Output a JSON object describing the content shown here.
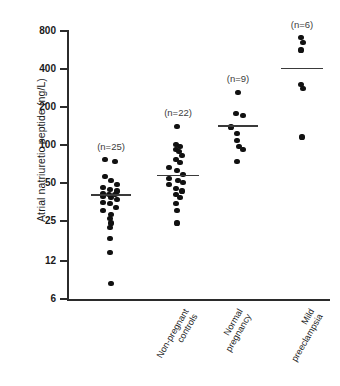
{
  "chart_data": {
    "type": "scatter",
    "title": "",
    "xlabel": "",
    "ylabel": "Atrial natriuretic peptide (ng/L)",
    "yscale": "log",
    "ylim": [
      6,
      800
    ],
    "yticks": [
      6,
      12,
      25,
      50,
      100,
      200,
      400,
      800
    ],
    "ytick_labels": [
      "6",
      "12",
      "25",
      "50",
      "100",
      "200",
      "400",
      "800"
    ],
    "grid": false,
    "legend": false,
    "categories": [
      "Non-pregnant controls",
      "Normal pregnancy",
      "Mild preeclampsia",
      "Severe preeclampsia"
    ],
    "groups": [
      {
        "name": "Non-pregnant controls",
        "label_line1": "Non-pregnant",
        "label_line2": "controls",
        "n_label": "(n=25)",
        "n": 25,
        "median": 40,
        "values": [
          76,
          74,
          56,
          52,
          48,
          46,
          44,
          43,
          41,
          40,
          40,
          39,
          38,
          37,
          35,
          34,
          32,
          30,
          28,
          26,
          24,
          22,
          18,
          14,
          8
        ]
      },
      {
        "name": "Normal pregnancy",
        "label_line1": "Normal",
        "label_line2": "pregnancy",
        "n_label": "(n=22)",
        "n": 22,
        "median": 57,
        "values": [
          140,
          100,
          96,
          92,
          88,
          82,
          76,
          72,
          66,
          62,
          58,
          54,
          52,
          50,
          48,
          45,
          43,
          40,
          38,
          34,
          30,
          24
        ]
      },
      {
        "name": "Mild preeclampsia",
        "label_line1": "Mild",
        "label_line2": "preeclampsia",
        "n_label": "(n=9)",
        "n": 9,
        "median": 140,
        "values": [
          260,
          175,
          170,
          138,
          122,
          108,
          96,
          92,
          74
        ]
      },
      {
        "name": "Severe preeclampsia",
        "label_line1": "Severe",
        "label_line2": "preeclampsia",
        "n_label": "(n=6)",
        "n": 6,
        "median": 400,
        "values": [
          700,
          640,
          560,
          300,
          280,
          115
        ]
      }
    ]
  },
  "colors": {
    "point": "#111111",
    "axis": "#2b2b2b",
    "median": "#3a3a3a",
    "text": "#1a1a1a",
    "background": "#ffffff"
  }
}
